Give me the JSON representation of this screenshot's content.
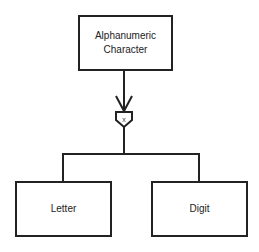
{
  "diagram": {
    "type": "hierarchy",
    "parent": {
      "label_line1": "Alphanumeric",
      "label_line2": "Character"
    },
    "connector": {
      "symbol": "x",
      "meaning": "exclusive-or selection",
      "arrow": "open-arrowhead-down"
    },
    "children": [
      {
        "label": "Letter"
      },
      {
        "label": "Digit"
      }
    ],
    "colors": {
      "stroke": "#222222",
      "background": "#ffffff",
      "text": "#222222"
    }
  }
}
